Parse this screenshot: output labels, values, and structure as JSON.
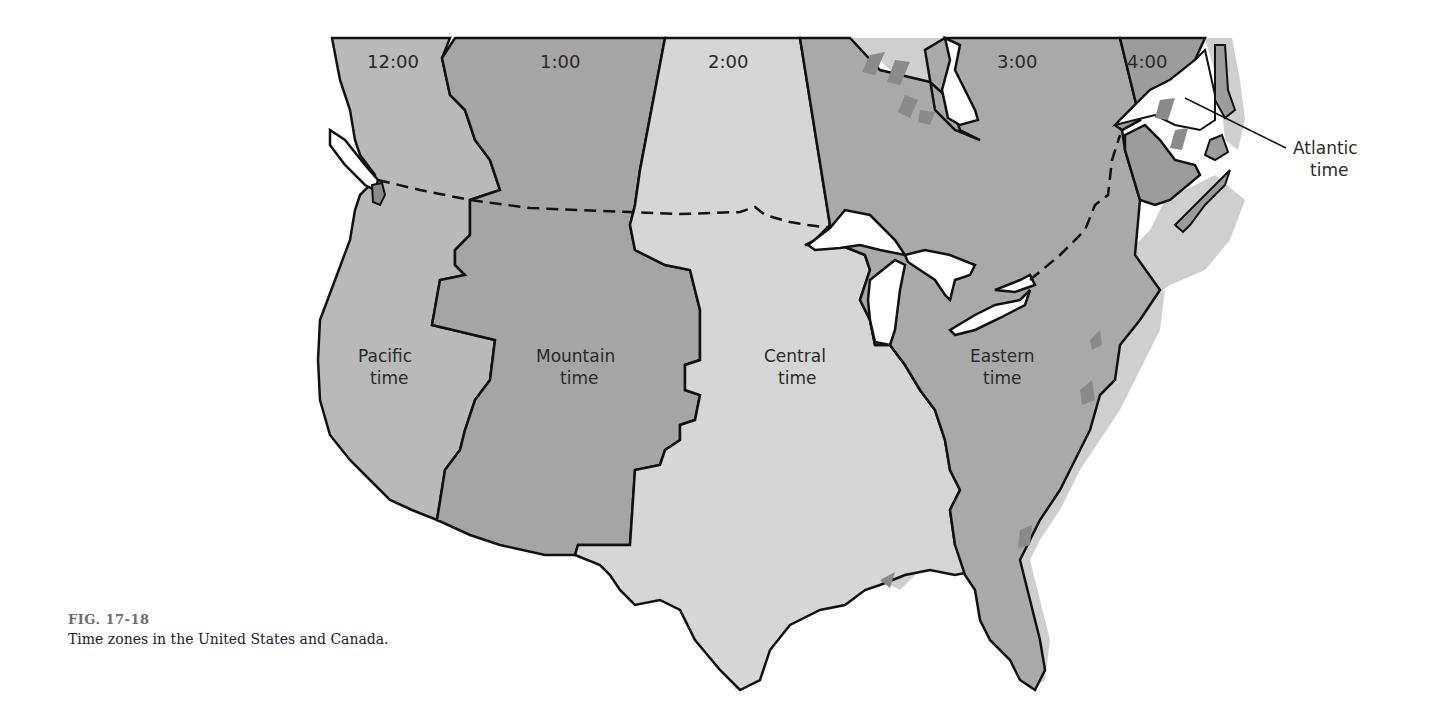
{
  "figure": {
    "number": "FIG. 17-18",
    "caption": "Time zones in the United States and Canada."
  },
  "colors": {
    "background": "#ffffff",
    "pacific": "#b9b9b9",
    "mountain": "#a5a5a5",
    "central": "#d6d6d6",
    "eastern": "#a9a9a9",
    "atlantic": "#9c9c9c",
    "water": "#ffffff",
    "border": "#111111",
    "coast_shadow": "#cfcfcf",
    "stripe": "#8a8a8a"
  },
  "map": {
    "hours": [
      {
        "id": "pacific",
        "label": "12:00"
      },
      {
        "id": "mountain",
        "label": "1:00"
      },
      {
        "id": "central",
        "label": "2:00"
      },
      {
        "id": "eastern",
        "label": "3:00"
      },
      {
        "id": "atlantic",
        "label": "4:00"
      }
    ],
    "zones": [
      {
        "id": "pacific",
        "line1": "Pacific",
        "line2": "time"
      },
      {
        "id": "mountain",
        "line1": "Mountain",
        "line2": "time"
      },
      {
        "id": "central",
        "line1": "Central",
        "line2": "time"
      },
      {
        "id": "eastern",
        "line1": "Eastern",
        "line2": "time"
      }
    ],
    "callout": {
      "line1": "Atlantic",
      "line2": "time"
    },
    "border_note": "dashed line = US–Canada border"
  }
}
